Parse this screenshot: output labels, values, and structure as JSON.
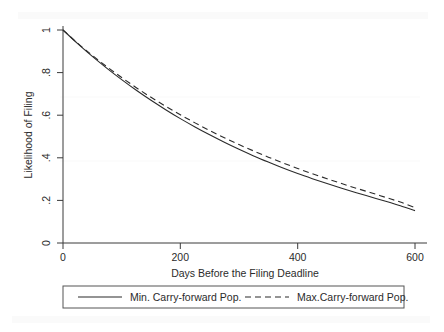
{
  "chart_data": {
    "type": "line",
    "title": "",
    "xlabel": "Days Before the Filing Deadline",
    "ylabel": "Likelihood of Filing",
    "xlim": [
      0,
      620
    ],
    "ylim": [
      0,
      1.05
    ],
    "xticks": [
      0,
      200,
      400,
      600
    ],
    "xtick_labels": [
      "0",
      "200",
      "400",
      "600"
    ],
    "yticks": [
      0,
      0.2,
      0.4,
      0.6,
      0.8,
      1
    ],
    "ytick_labels": [
      "0",
      ".2",
      ".4",
      ".6",
      ".8",
      "1"
    ],
    "grid": false,
    "legend_position": "bottom",
    "x": [
      0,
      25,
      50,
      75,
      100,
      125,
      150,
      175,
      200,
      225,
      250,
      275,
      300,
      325,
      350,
      375,
      400,
      425,
      450,
      475,
      500,
      525,
      550,
      575,
      600
    ],
    "series": [
      {
        "name": "Min. Carry-forward Pop.",
        "style": "solid",
        "color": "#2b2b2b",
        "values": [
          1.0,
          0.936,
          0.876,
          0.82,
          0.767,
          0.717,
          0.67,
          0.626,
          0.584,
          0.545,
          0.508,
          0.473,
          0.44,
          0.409,
          0.38,
          0.352,
          0.326,
          0.302,
          0.279,
          0.257,
          0.236,
          0.216,
          0.196,
          0.175,
          0.152
        ]
      },
      {
        "name": "Max.Carry-forward Pop.",
        "style": "dashed",
        "color": "#2b2b2b",
        "values": [
          1.0,
          0.938,
          0.881,
          0.827,
          0.777,
          0.729,
          0.684,
          0.642,
          0.602,
          0.564,
          0.528,
          0.494,
          0.462,
          0.432,
          0.403,
          0.376,
          0.35,
          0.325,
          0.302,
          0.279,
          0.257,
          0.236,
          0.214,
          0.192,
          0.166
        ]
      }
    ]
  },
  "axes": {
    "x_title": "Days Before the Filing Deadline",
    "y_title": "Likelihood of Filing",
    "x_tick_labels": [
      "0",
      "200",
      "400",
      "600"
    ],
    "y_tick_labels": [
      "0",
      ".2",
      ".4",
      ".6",
      ".8",
      "1"
    ]
  },
  "legend": {
    "entries": [
      {
        "label": "Min. Carry-forward Pop.",
        "style": "solid"
      },
      {
        "label": "Max.Carry-forward Pop.",
        "style": "dashed"
      }
    ]
  },
  "colors": {
    "line": "#2b2b2b",
    "axis": "#3a3a3a",
    "text": "#2b2b2b",
    "background": "#ffffff",
    "legend_border": "#555555"
  }
}
